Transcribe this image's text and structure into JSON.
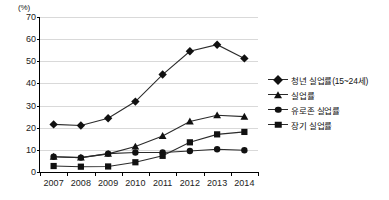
{
  "chart_data": {
    "type": "line",
    "title": "",
    "xlabel": "",
    "ylabel": "",
    "unit_label": "(%)",
    "categories": [
      "2007",
      "2008",
      "2009",
      "2010",
      "2011",
      "2012",
      "2013",
      "2014"
    ],
    "ylim": [
      0,
      70
    ],
    "yticks": [
      0,
      10,
      20,
      30,
      40,
      50,
      60,
      70
    ],
    "grid": true,
    "legend_position": "right",
    "series": [
      {
        "name": "청년 실업률(15~24세)",
        "marker": "diamond",
        "values": [
          21.5,
          21.0,
          24.3,
          31.8,
          44.0,
          54.5,
          57.5,
          51.3
        ]
      },
      {
        "name": "실업률",
        "marker": "triangle",
        "values": [
          6.9,
          6.5,
          8.2,
          11.5,
          16.3,
          22.8,
          25.6,
          25.0
        ]
      },
      {
        "name": "유로존 실업률",
        "marker": "circle",
        "values": [
          6.9,
          6.5,
          8.3,
          8.8,
          8.8,
          9.5,
          10.3,
          9.8
        ]
      },
      {
        "name": "장기 실업률",
        "marker": "square",
        "values": [
          2.7,
          2.4,
          2.5,
          4.4,
          7.3,
          13.4,
          17.0,
          18.1
        ]
      }
    ],
    "colors": {
      "line": "#2b2b2b",
      "marker": "#111111",
      "grid": "#d9d9d9",
      "axis": "#000000",
      "background": "#ffffff"
    }
  }
}
